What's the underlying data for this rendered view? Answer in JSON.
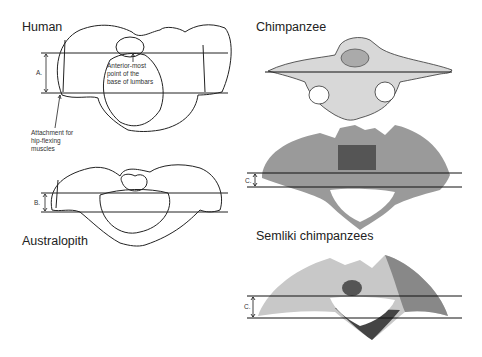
{
  "panels": {
    "human": {
      "title": "Human",
      "measure_label": "A."
    },
    "australopith": {
      "title": "Australopith",
      "measure_label": "B."
    },
    "chimpanzee": {
      "title": "Chimpanzee"
    },
    "semliki_upper": {
      "measure_label": "C."
    },
    "semliki": {
      "title": "Semliki chimpanzees",
      "measure_label": "C."
    }
  },
  "annotations": {
    "lumbar_line1": "Anterior-most",
    "lumbar_line2": "point of the",
    "lumbar_line3": "base of lumbars",
    "hip_line1": "Attachment for",
    "hip_line2": "hip-flexing",
    "hip_line3": "muscles"
  }
}
